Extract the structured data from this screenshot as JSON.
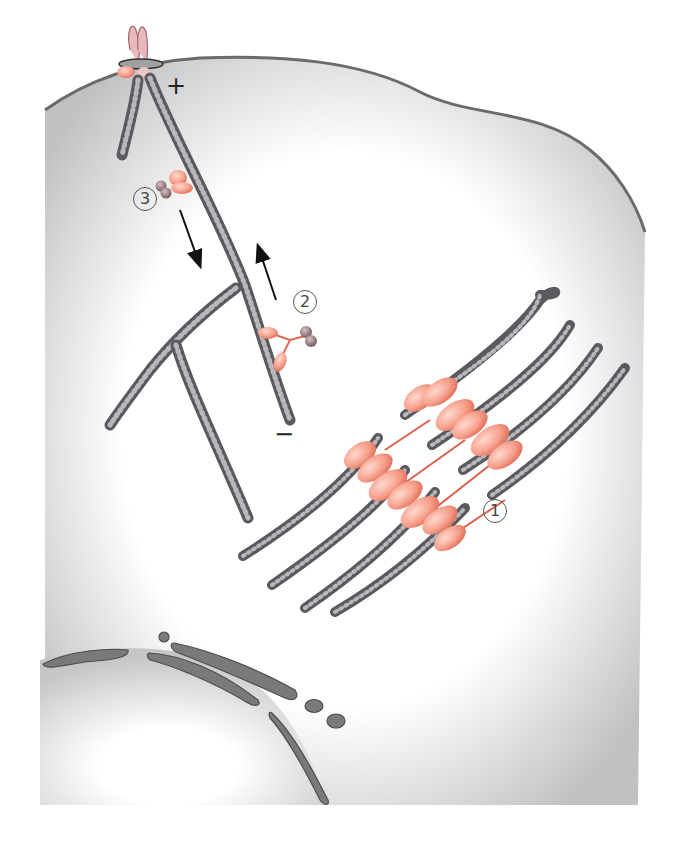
{
  "diagram": {
    "colors": {
      "cytoplasm_edge": "#bfc1c3",
      "cytoplasm_center": "#ffffff",
      "membrane_stroke": "#6b6b6b",
      "actin_bead": "#5a5a5e",
      "actin_highlight": "#c9c9cc",
      "myosin": "#f39a86",
      "myosin_stroke": "#e06a55",
      "cargo": "#8a6e70",
      "nuclear_envelope": "#707070"
    },
    "labels": {
      "plus_end": "+",
      "minus_end": "−",
      "label_1": "1",
      "label_2": "2",
      "label_3": "3"
    },
    "annotations": [
      {
        "id": "1",
        "description": "myosin II bipolar filaments between antiparallel actin (contractile bundle)"
      },
      {
        "id": "2",
        "description": "myosin V carrying cargo toward the plus end"
      },
      {
        "id": "3",
        "description": "myosin VI carrying cargo toward the minus end"
      }
    ],
    "arrows": [
      {
        "direction": "down",
        "near": "3"
      },
      {
        "direction": "up",
        "near": "2"
      }
    ]
  }
}
